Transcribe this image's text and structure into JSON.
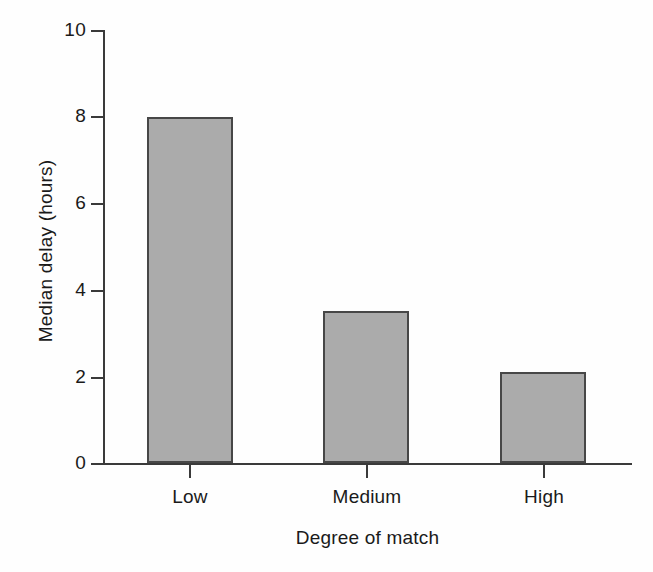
{
  "chart_data": {
    "type": "bar",
    "title": "",
    "categories": [
      "Low",
      "Medium",
      "High"
    ],
    "values": [
      8.0,
      3.5,
      2.1
    ],
    "series": [
      {
        "name": "Median delay",
        "values": [
          8.0,
          3.5,
          2.1
        ]
      }
    ],
    "xlabel": "Degree of  match",
    "ylabel": "Median delay (hours)",
    "ylim": [
      0,
      10
    ],
    "yticks": [
      0,
      2,
      4,
      6,
      8,
      10
    ],
    "ytick_labels": [
      "0",
      "2",
      "4",
      "6",
      "8",
      "10"
    ],
    "grid": false,
    "legend": false,
    "legend_position": "none",
    "bar_fill_color": "#ababab",
    "bar_edge_color": "#474747",
    "axis_color": "#3a3a3a",
    "background_color": "#fefefe"
  },
  "axis": {
    "y_label": "Median delay (hours)",
    "x_label": "Degree of  match"
  }
}
